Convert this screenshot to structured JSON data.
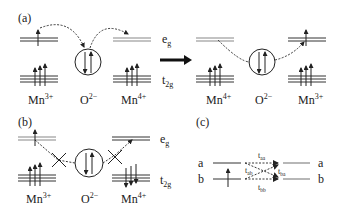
{
  "panels": {
    "a": {
      "label": "(a)",
      "left": {
        "ion1": "Mn",
        "ion1_charge": "3+",
        "oxygen": "O",
        "oxygen_charge": "2−",
        "ion2": "Mn",
        "ion2_charge": "4+"
      },
      "right": {
        "ion1": "Mn",
        "ion1_charge": "4+",
        "oxygen": "O",
        "oxygen_charge": "2−",
        "ion2": "Mn",
        "ion2_charge": "3+"
      },
      "eg_label": "e",
      "eg_sub": "g",
      "t2g_label": "t",
      "t2g_sub": "2g"
    },
    "b": {
      "label": "(b)",
      "ion1": "Mn",
      "ion1_charge": "3+",
      "oxygen": "O",
      "oxygen_charge": "2−",
      "ion2": "Mn",
      "ion2_charge": "4+",
      "eg_label": "e",
      "eg_sub": "g",
      "t2g_label": "t",
      "t2g_sub": "2g"
    },
    "c": {
      "label": "(c)",
      "left_a": "a",
      "left_b": "b",
      "right_a": "a",
      "right_b": "b",
      "t_aa": "t",
      "t_aa_sub": "aa",
      "t_ab": "t",
      "t_ab_sub": "ab",
      "t_ba": "t",
      "t_ba_sub": "ba",
      "t_bb": "t",
      "t_bb_sub": "bb"
    }
  },
  "colors": {
    "line": "#333333",
    "eg_line": "#888888",
    "ink": "#222222"
  }
}
